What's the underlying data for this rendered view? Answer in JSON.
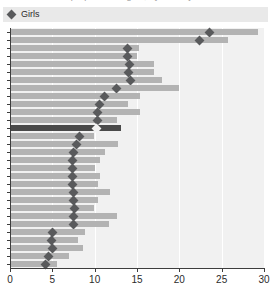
{
  "title_remnant": "estimate of the proportion of girls, by country",
  "legend": {
    "marker_icon": "diamond-marker-icon",
    "label": "Girls"
  },
  "colors": {
    "bar": "#b3b3b3",
    "bar_highlight": "#4a4a4a",
    "marker": "#595a5c",
    "marker_highlight": "#f2f2f2",
    "plot_background": "#f1f1f1",
    "gridline": "#ffffff",
    "axis": "#3d3d3d",
    "legend_background": "#e9e9e9"
  },
  "chart_data": {
    "type": "bar",
    "orientation": "horizontal",
    "title": "",
    "xlabel": "",
    "ylabel": "",
    "xlim": [
      0,
      30
    ],
    "xticks": [
      0,
      5,
      10,
      15,
      20,
      25,
      30
    ],
    "xtick_labels": [
      "0",
      "5",
      "10",
      "15",
      "20",
      "25",
      "30"
    ],
    "grid": "vertical",
    "legend_position": "top-left",
    "series": [
      {
        "name": "Range bar",
        "type": "bar",
        "values": [
          29.3,
          25.8,
          15.2,
          15.0,
          17.0,
          17.0,
          18.0,
          20.0,
          15.3,
          13.9,
          15.3,
          12.6,
          13.1,
          9.9,
          12.7,
          11.2,
          10.6,
          10.0,
          10.6,
          10.4,
          11.8,
          10.4,
          9.9,
          12.6,
          11.7,
          8.9,
          8.0,
          8.6,
          7.0,
          5.6
        ]
      },
      {
        "name": "Girls",
        "type": "marker",
        "marker": "diamond",
        "values": [
          23.6,
          22.4,
          13.9,
          13.9,
          14.1,
          14.0,
          14.2,
          12.6,
          11.2,
          10.6,
          10.3,
          10.3,
          10.2,
          8.2,
          7.9,
          7.5,
          7.4,
          7.4,
          7.4,
          7.4,
          7.5,
          7.5,
          7.6,
          7.5,
          7.5,
          5.0,
          4.9,
          5.0,
          4.5,
          4.2
        ]
      }
    ],
    "highlighted_row_index": 12,
    "row_count": 30
  }
}
